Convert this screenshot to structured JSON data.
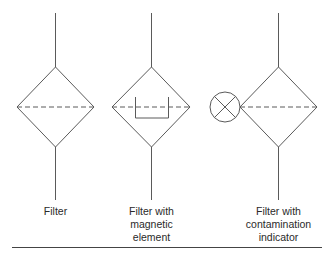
{
  "diagram": {
    "type": "hydraulic-filter-symbols",
    "stroke_color": "#555555",
    "rule_color": "#444444",
    "symbols": [
      {
        "id": "filter",
        "label_lines": [
          "Filter"
        ]
      },
      {
        "id": "filter-magnetic",
        "label_lines": [
          "Filter with",
          "magnetic",
          "element"
        ]
      },
      {
        "id": "filter-contamination",
        "label_lines": [
          "Filter with",
          "contamination",
          "indicator"
        ]
      }
    ]
  }
}
